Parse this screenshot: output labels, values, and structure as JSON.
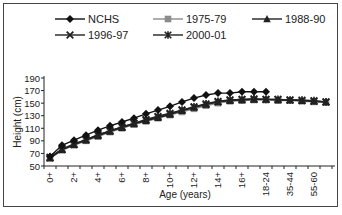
{
  "chart_data": {
    "type": "line",
    "title": "",
    "xlabel": "Age (years)",
    "ylabel": "Height (cm)",
    "ylim": [
      50,
      190
    ],
    "yticks": [
      50,
      70,
      90,
      110,
      130,
      150,
      170,
      190
    ],
    "grid": false,
    "legend_position": "top",
    "categories": [
      "0+",
      "1+",
      "2+",
      "3+",
      "4+",
      "5+",
      "6+",
      "7+",
      "8+",
      "9+",
      "10+",
      "11+",
      "12+",
      "13+",
      "14+",
      "15+",
      "16+",
      "17+",
      "18-24",
      "25-34",
      "35-44",
      "45-54",
      "55-60",
      "61+"
    ],
    "x_tick_labels_shown": [
      "0+",
      "2+",
      "4+",
      "6+",
      "8+",
      "10+",
      "12+",
      "14+",
      "16+",
      "18-24",
      "35-44",
      "55-60"
    ],
    "series": [
      {
        "name": "NCHS",
        "marker": "diamond",
        "color": "#111111",
        "values": [
          65,
          83,
          91,
          99,
          107,
          114,
          120,
          126,
          133,
          139,
          145,
          152,
          158,
          163,
          166,
          166,
          168,
          168,
          168,
          null,
          null,
          null,
          null,
          null
        ]
      },
      {
        "name": "1975-79",
        "marker": "square",
        "color": "#8c8c8c",
        "values": [
          62,
          75,
          83,
          90,
          97,
          104,
          110,
          116,
          121,
          126,
          131,
          136,
          141,
          146,
          150,
          153,
          154,
          155,
          155,
          154,
          154,
          153,
          152,
          151
        ]
      },
      {
        "name": "1988-90",
        "marker": "triangle",
        "color": "#222222",
        "values": [
          63,
          76,
          84,
          91,
          98,
          105,
          111,
          117,
          122,
          127,
          132,
          138,
          143,
          148,
          152,
          154,
          155,
          156,
          156,
          155,
          155,
          154,
          153,
          152
        ]
      },
      {
        "name": "1996-97",
        "marker": "x",
        "color": "#222222",
        "values": [
          63,
          76,
          84,
          92,
          99,
          106,
          112,
          118,
          123,
          128,
          133,
          139,
          144,
          148,
          152,
          155,
          156,
          156,
          156,
          156,
          155,
          154,
          153,
          152
        ]
      },
      {
        "name": "2000-01",
        "marker": "star",
        "color": "#222222",
        "values": [
          64,
          77,
          85,
          92,
          100,
          106,
          112,
          118,
          124,
          129,
          134,
          139,
          144,
          149,
          153,
          155,
          156,
          157,
          156,
          156,
          155,
          155,
          154,
          152
        ]
      }
    ]
  }
}
